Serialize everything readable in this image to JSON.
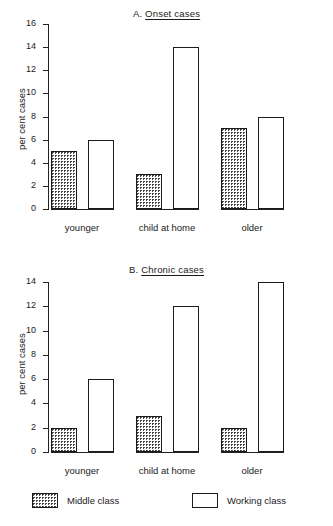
{
  "figure": {
    "series_names": [
      "Middle class",
      "Working class"
    ],
    "legend": {
      "middle_label": "Middle class",
      "working_label": "Working class"
    }
  },
  "panels": [
    {
      "id": "a",
      "prefix": "A.",
      "title": "Onset cases",
      "full_title": "A. Onset cases",
      "ylabel": "per cent cases",
      "yticks": [
        "16",
        "14",
        "12",
        "10",
        "8",
        "6",
        "4",
        "2",
        "0"
      ],
      "ymax": 16,
      "categories": [
        "younger",
        "child at home",
        "older"
      ],
      "middle_values": [
        "5",
        "3",
        "7"
      ],
      "working_values": [
        "6",
        "14",
        "8"
      ]
    },
    {
      "id": "b",
      "prefix": "B.",
      "title": "Chronic cases",
      "full_title": "B. Chronic cases",
      "ylabel": "per cent cases",
      "yticks": [
        "14",
        "12",
        "10",
        "8",
        "6",
        "4",
        "2",
        "0"
      ],
      "ymax": 14,
      "categories": [
        "younger",
        "child at home",
        "older"
      ],
      "middle_values": [
        "2",
        "3",
        "2"
      ],
      "working_values": [
        "6",
        "12",
        "14"
      ]
    }
  ],
  "chart_data": [
    {
      "type": "bar",
      "title": "A. Onset cases",
      "xlabel": "",
      "ylabel": "per cent cases",
      "ylim": [
        0,
        16
      ],
      "ytick_step": 2,
      "grid": false,
      "legend_position": "bottom",
      "categories": [
        "younger",
        "child at home",
        "older"
      ],
      "series": [
        {
          "name": "Middle class",
          "values": [
            5,
            3,
            7
          ],
          "fill": "dotted"
        },
        {
          "name": "Working class",
          "values": [
            6,
            14,
            8
          ],
          "fill": "white"
        }
      ]
    },
    {
      "type": "bar",
      "title": "B. Chronic cases",
      "xlabel": "",
      "ylabel": "per cent cases",
      "ylim": [
        0,
        14
      ],
      "ytick_step": 2,
      "grid": false,
      "legend_position": "bottom",
      "categories": [
        "younger",
        "child at home",
        "older"
      ],
      "series": [
        {
          "name": "Middle class",
          "values": [
            2,
            3,
            2
          ],
          "fill": "dotted"
        },
        {
          "name": "Working class",
          "values": [
            6,
            12,
            14
          ],
          "fill": "white"
        }
      ]
    }
  ]
}
